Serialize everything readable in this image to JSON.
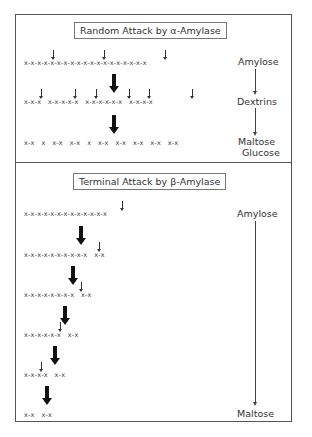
{
  "random_attack": {
    "title": "Random Attack by α-Amylase",
    "rows": [
      {
        "chain": "x-x-x-x-x-x-x-x-x-x-x-x-x-x-x-x-x-x-x",
        "label": "Amylose"
      },
      {
        "chain": "x-x-x   x-x-x-x-x   x-x-x-x-x-x   x-x-x-x",
        "label": "Dextrins"
      },
      {
        "chain": "x-x   x   x-x   x-x   x   x-x   x-x   x-x   x-x   x-x",
        "label": "Maltose",
        "label2": "Glucose"
      }
    ]
  },
  "terminal_attack": {
    "title": "Terminal Attack by β-Amylase",
    "rows": [
      {
        "chain": "x-x-x-x-x-x-x-x-x-x-x-x-x",
        "label": "Amylose"
      },
      {
        "chain": "x-x-x-x-x-x-x-x-x-x   x-x"
      },
      {
        "chain": "x-x-x-x-x-x-x-x   x-x"
      },
      {
        "chain": "x-x-x-x-x-x   x-x"
      },
      {
        "chain": "x-x-x-x   x-x"
      },
      {
        "chain": "x-x   x-x",
        "label": "Maltose"
      }
    ]
  }
}
